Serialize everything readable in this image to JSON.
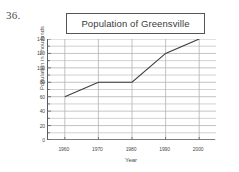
{
  "problem": {
    "number": "36."
  },
  "chart_data": {
    "type": "line",
    "title": "Population of Greensville",
    "xlabel": "Year",
    "ylabel": "Population in Thousands",
    "x": [
      1960,
      1970,
      1980,
      1990,
      2000
    ],
    "values": [
      60,
      80,
      80,
      120,
      140
    ],
    "categories": [
      "1960",
      "1970",
      "1980",
      "1990",
      "2000"
    ],
    "xtick_labels": [
      "1960",
      "1970",
      "1980",
      "1990",
      "2000"
    ],
    "ytick_labels": [
      "0",
      "20",
      "40",
      "60",
      "80",
      "100",
      "120",
      "140"
    ],
    "ytick_values": [
      0,
      20,
      40,
      60,
      80,
      100,
      120,
      140
    ],
    "yminor_step": 10,
    "xlim": [
      1955,
      2005
    ],
    "ylim": [
      0,
      140
    ],
    "grid": "horizontal-major-and-minor, vertical-at-xticks",
    "legend": "none",
    "line_color": "#3c3c3c",
    "grid_color": "#b4b4b4",
    "axis_color": "#5a5a5a",
    "background_color": "#ffffff"
  }
}
